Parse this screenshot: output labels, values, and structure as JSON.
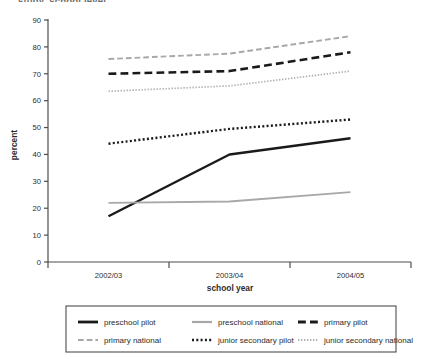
{
  "figure": {
    "clipped_title": "study, school level"
  },
  "chart_data": {
    "type": "line",
    "title": "",
    "xlabel": "school year",
    "ylabel": "percent",
    "categories": [
      "2002/03",
      "2003/04",
      "2004/05"
    ],
    "ylim": [
      0,
      90
    ],
    "yticks": [
      0,
      10,
      20,
      30,
      40,
      50,
      60,
      70,
      80,
      90
    ],
    "grid": false,
    "legend_position": "bottom",
    "series": [
      {
        "name": "preschool pilot",
        "values": [
          17,
          40,
          46
        ],
        "style": "solid",
        "color": "#1a1a1a",
        "width": 2.4
      },
      {
        "name": "preschool national",
        "values": [
          22,
          22.5,
          26
        ],
        "style": "solid",
        "color": "#a8a8a8",
        "width": 1.8
      },
      {
        "name": "primary pilot",
        "values": [
          70,
          71,
          78
        ],
        "style": "dashed",
        "color": "#1a1a1a",
        "width": 2.6
      },
      {
        "name": "primary national",
        "values": [
          75.5,
          77.5,
          84
        ],
        "style": "dashed",
        "color": "#a8a8a8",
        "width": 1.9
      },
      {
        "name": "junior secondary pilot",
        "values": [
          44,
          49.5,
          53
        ],
        "style": "dotted",
        "color": "#1a1a1a",
        "width": 2.4
      },
      {
        "name": "junior secondary national",
        "values": [
          63.5,
          65.5,
          71
        ],
        "style": "dotted",
        "color": "#b0b0b0",
        "width": 1.7
      }
    ]
  },
  "legend": {
    "entries": [
      {
        "label": "preschool pilot"
      },
      {
        "label": "preschool national"
      },
      {
        "label": "primary pilot"
      },
      {
        "label": "primary national"
      },
      {
        "label": "junior secondary pilot"
      },
      {
        "label": "junior secondary national"
      }
    ]
  }
}
